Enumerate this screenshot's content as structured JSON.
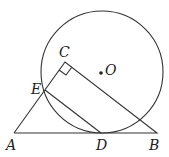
{
  "diagram": {
    "labels": {
      "A": "A",
      "B": "B",
      "C": "C",
      "D": "D",
      "E": "E",
      "O": "O"
    },
    "elements": [
      "circle O tangent to AB at D",
      "triangle ABC with right angle at C",
      "segment ED"
    ]
  }
}
